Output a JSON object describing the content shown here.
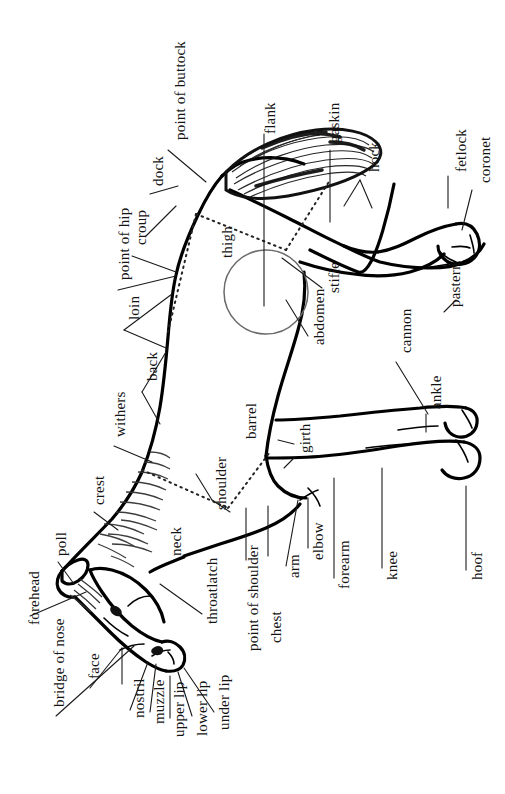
{
  "figure": {
    "orientation": "labels rotated 90 degrees counter-clockwise",
    "ink_color": "#141414",
    "background_color": "#ffffff",
    "line_color": "#000000",
    "guide_color": "#555555"
  },
  "labels": [
    {
      "id": "point-of-buttock",
      "text": "point of buttock",
      "x": 173,
      "y": 140,
      "size": "normal"
    },
    {
      "id": "flank",
      "text": "flank",
      "x": 263,
      "y": 134,
      "size": "normal"
    },
    {
      "id": "gaskin",
      "text": "gaskin",
      "x": 327,
      "y": 143,
      "size": "normal"
    },
    {
      "id": "hock",
      "text": "hock",
      "x": 367,
      "y": 172,
      "size": "normal"
    },
    {
      "id": "fetlock",
      "text": "fetlock",
      "x": 454,
      "y": 172,
      "size": "normal"
    },
    {
      "id": "coronet",
      "text": "coronet",
      "x": 478,
      "y": 183,
      "size": "normal"
    },
    {
      "id": "dock",
      "text": "dock",
      "x": 151,
      "y": 186,
      "size": "normal"
    },
    {
      "id": "croup",
      "text": "croup",
      "x": 134,
      "y": 245,
      "size": "normal"
    },
    {
      "id": "point-of-hip",
      "text": "point of hip",
      "x": 117,
      "y": 280,
      "size": "normal"
    },
    {
      "id": "thigh",
      "text": "thigh",
      "x": 220,
      "y": 258,
      "size": "normal"
    },
    {
      "id": "stifle",
      "text": "stifle",
      "x": 327,
      "y": 293,
      "size": "normal"
    },
    {
      "id": "pastern",
      "text": "pastern",
      "x": 448,
      "y": 307,
      "size": "normal"
    },
    {
      "id": "loin",
      "text": "loin",
      "x": 127,
      "y": 320,
      "size": "normal"
    },
    {
      "id": "abdomen",
      "text": "abdomen",
      "x": 312,
      "y": 345,
      "size": "normal"
    },
    {
      "id": "back",
      "text": "back",
      "x": 145,
      "y": 381,
      "size": "normal"
    },
    {
      "id": "cannon",
      "text": "cannon",
      "x": 399,
      "y": 353,
      "size": "normal"
    },
    {
      "id": "ankle",
      "text": "ankle",
      "x": 429,
      "y": 409,
      "size": "normal"
    },
    {
      "id": "withers",
      "text": "withers",
      "x": 113,
      "y": 437,
      "size": "normal"
    },
    {
      "id": "barrel",
      "text": "barrel",
      "x": 244,
      "y": 439,
      "size": "normal"
    },
    {
      "id": "girth",
      "text": "girth",
      "x": 298,
      "y": 453,
      "size": "normal"
    },
    {
      "id": "crest",
      "text": "crest",
      "x": 92,
      "y": 505,
      "size": "normal"
    },
    {
      "id": "shoulder",
      "text": "shoulder",
      "x": 214,
      "y": 510,
      "size": "normal"
    },
    {
      "id": "neck",
      "text": "neck",
      "x": 169,
      "y": 556,
      "size": "normal"
    },
    {
      "id": "poll",
      "text": "poll",
      "x": 54,
      "y": 556,
      "size": "normal"
    },
    {
      "id": "elbow",
      "text": "elbow",
      "x": 311,
      "y": 560,
      "size": "normal"
    },
    {
      "id": "arm",
      "text": "arm",
      "x": 287,
      "y": 578,
      "size": "normal"
    },
    {
      "id": "forearm",
      "text": "forearm",
      "x": 337,
      "y": 589,
      "size": "normal"
    },
    {
      "id": "knee",
      "text": "knee",
      "x": 385,
      "y": 580,
      "size": "normal"
    },
    {
      "id": "hoof",
      "text": "hoof",
      "x": 470,
      "y": 580,
      "size": "normal"
    },
    {
      "id": "throatlatch",
      "text": "throatlatch",
      "x": 205,
      "y": 624,
      "size": "normal"
    },
    {
      "id": "forehead",
      "text": "forehead",
      "x": 27,
      "y": 625,
      "size": "normal"
    },
    {
      "id": "point-of-shoulder",
      "text": "point of shoulder",
      "x": 246,
      "y": 651,
      "size": "normal"
    },
    {
      "id": "bridge-of-nose",
      "text": "bridge of nose",
      "x": 52,
      "y": 707,
      "size": "normal"
    },
    {
      "id": "face",
      "text": "face",
      "x": 87,
      "y": 679,
      "size": "normal"
    },
    {
      "id": "chest",
      "text": "chest",
      "x": 269,
      "y": 643,
      "size": "normal"
    },
    {
      "id": "nostril",
      "text": "nostril",
      "x": 132,
      "y": 718,
      "size": "normal"
    },
    {
      "id": "muzzle",
      "text": "muzzle",
      "x": 152,
      "y": 724,
      "size": "normal"
    },
    {
      "id": "upper-lip",
      "text": "upper lip",
      "x": 172,
      "y": 737,
      "size": "normal"
    },
    {
      "id": "lower-lip",
      "text": "lower lip",
      "x": 195,
      "y": 736,
      "size": "normal"
    },
    {
      "id": "under-lip",
      "text": "under lip",
      "x": 217,
      "y": 730,
      "size": "normal"
    }
  ],
  "parts_list": [
    "point of buttock",
    "flank",
    "gaskin",
    "hock",
    "fetlock",
    "coronet",
    "dock",
    "croup",
    "point of hip",
    "thigh",
    "stifle",
    "pastern",
    "loin",
    "abdomen",
    "back",
    "cannon",
    "ankle",
    "withers",
    "barrel",
    "girth",
    "crest",
    "shoulder",
    "neck",
    "poll",
    "elbow",
    "arm",
    "forearm",
    "knee",
    "hoof",
    "throatlatch",
    "forehead",
    "point of shoulder",
    "bridge of nose",
    "face",
    "chest",
    "nostril",
    "muzzle",
    "upper lip",
    "lower lip",
    "under lip"
  ]
}
